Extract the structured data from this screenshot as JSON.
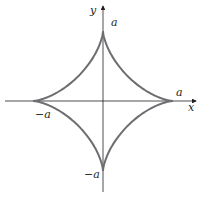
{
  "diagram": {
    "axes": {
      "x_label": "x",
      "y_label": "y"
    },
    "labels": {
      "top": "a",
      "bottom": "−a",
      "left": "−a",
      "right": "a"
    },
    "colors": {
      "curve": "#6d6e71",
      "axes": "#231f20",
      "text": "#231f20"
    }
  }
}
